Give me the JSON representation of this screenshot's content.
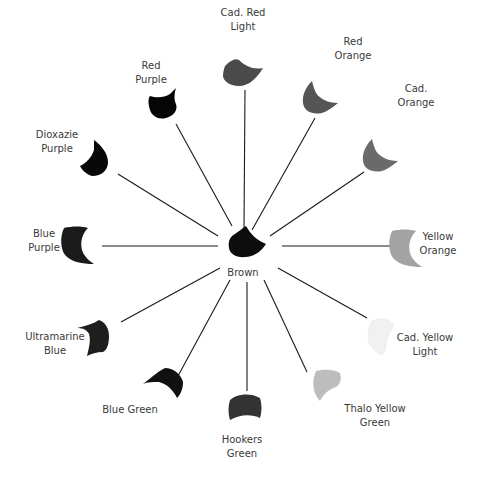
{
  "diagram": {
    "center": {
      "label": "Brown",
      "color": "#0d0d0d"
    },
    "spokes": [
      {
        "id": "cad-red-light",
        "lines": [
          "Cad. Red",
          "Light"
        ],
        "color": "#4a4a4a"
      },
      {
        "id": "red-orange",
        "lines": [
          "Red",
          "Orange"
        ],
        "color": "#555555"
      },
      {
        "id": "cad-orange",
        "lines": [
          "Cad.",
          "Orange"
        ],
        "color": "#6a6a6a"
      },
      {
        "id": "yellow-orange",
        "lines": [
          "Yellow",
          "Orange"
        ],
        "color": "#a3a3a3"
      },
      {
        "id": "cad-yellow-light",
        "lines": [
          "Cad. Yellow",
          "Light"
        ],
        "color": "#f1f1f1"
      },
      {
        "id": "thalo-yellow-green",
        "lines": [
          "Thalo Yellow",
          "Green"
        ],
        "color": "#bdbdbd"
      },
      {
        "id": "hookers-green",
        "lines": [
          "Hookers",
          "Green"
        ],
        "color": "#333333"
      },
      {
        "id": "blue-green",
        "lines": [
          "Blue Green"
        ],
        "color": "#111111"
      },
      {
        "id": "ultramarine-blue",
        "lines": [
          "Ultramarine",
          "Blue"
        ],
        "color": "#1e1e1e"
      },
      {
        "id": "blue-purple",
        "lines": [
          "Blue",
          "Purple"
        ],
        "color": "#1a1a1a"
      },
      {
        "id": "dioxazie-purple",
        "lines": [
          "Dioxazie",
          "Purple"
        ],
        "color": "#080808"
      },
      {
        "id": "red-purple",
        "lines": [
          "Red",
          "Purple"
        ],
        "color": "#050505"
      }
    ]
  }
}
